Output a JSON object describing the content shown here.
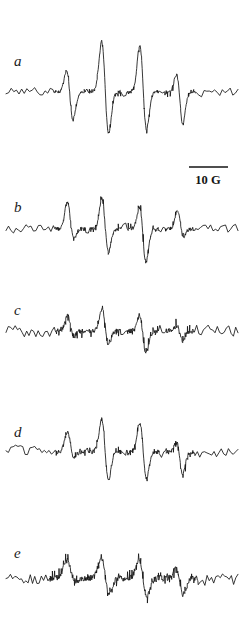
{
  "figure": {
    "type": "epr-spectra-stack",
    "width": 245,
    "height": 631,
    "background_color": "#ffffff",
    "line_color": "#141414"
  },
  "scale_bar": {
    "label": "10 G",
    "x_start": 189,
    "x_end": 228,
    "y": 167,
    "text_x": 208,
    "text_y": 184,
    "gauss_value": 10,
    "units": "G"
  },
  "chart_data": {
    "type": "line",
    "title": "",
    "subtitle": "",
    "xlabel": "",
    "ylabel": "",
    "grid": false,
    "legend_position": "none",
    "axis_visible": false,
    "x_range": [
      0,
      245
    ],
    "y_range_note": "arbitrary derivative intensity, each trace on own baseline",
    "scale_reference": {
      "length_px": 39,
      "value": 10,
      "units": "G"
    },
    "hyperfine_line_positions_px": [
      70,
      105,
      143,
      180
    ],
    "hyperfine_line_count": 4,
    "series": [
      {
        "name": "a",
        "label": "a",
        "label_x": 14,
        "label_y": 66,
        "baseline_y": 92,
        "x_start": 6,
        "x_end": 238,
        "noise_amplitude": 5.0,
        "noise_seed": 101,
        "noise_step": 2.6,
        "smooth": 0.22,
        "drift": [
          0,
          1,
          0,
          -1,
          0
        ],
        "peaks": [
          {
            "center": 70,
            "up": 38,
            "down": 44,
            "width": 3.1,
            "sep": 3.4
          },
          {
            "center": 105,
            "up": 80,
            "down": 72,
            "width": 3.3,
            "sep": 3.6
          },
          {
            "center": 143,
            "up": 74,
            "down": 66,
            "width": 3.2,
            "sep": 3.5
          },
          {
            "center": 180,
            "up": 34,
            "down": 46,
            "width": 3.0,
            "sep": 3.3
          }
        ]
      },
      {
        "name": "b",
        "label": "b",
        "label_x": 14,
        "label_y": 212,
        "baseline_y": 229,
        "x_start": 6,
        "x_end": 238,
        "noise_amplitude": 5.4,
        "noise_seed": 227,
        "noise_step": 2.5,
        "smooth": 0.2,
        "drift": [
          0,
          0,
          1,
          0,
          0
        ],
        "peaks": [
          {
            "center": 70,
            "up": 37,
            "down": 22,
            "width": 3.0,
            "sep": 3.3
          },
          {
            "center": 105,
            "up": 47,
            "down": 41,
            "width": 3.1,
            "sep": 3.4
          },
          {
            "center": 143,
            "up": 40,
            "down": 50,
            "width": 3.1,
            "sep": 3.4
          },
          {
            "center": 180,
            "up": 25,
            "down": 16,
            "width": 2.9,
            "sep": 3.2
          }
        ]
      },
      {
        "name": "c",
        "label": "c",
        "label_x": 14,
        "label_y": 315,
        "baseline_y": 331,
        "x_start": 6,
        "x_end": 238,
        "noise_amplitude": 6.6,
        "noise_seed": 349,
        "noise_step": 2.3,
        "smooth": 0.16,
        "drift": [
          0,
          -1,
          0,
          1,
          0
        ],
        "peaks": [
          {
            "center": 70,
            "up": 21,
            "down": 12,
            "width": 3.0,
            "sep": 3.2
          },
          {
            "center": 105,
            "up": 33,
            "down": 26,
            "width": 3.1,
            "sep": 3.3
          },
          {
            "center": 143,
            "up": 29,
            "down": 35,
            "width": 3.1,
            "sep": 3.3
          },
          {
            "center": 180,
            "up": 10,
            "down": 14,
            "width": 2.9,
            "sep": 3.1
          }
        ]
      },
      {
        "name": "d",
        "label": "d",
        "label_x": 14,
        "label_y": 437,
        "baseline_y": 452,
        "x_start": 6,
        "x_end": 238,
        "noise_amplitude": 6.0,
        "noise_seed": 463,
        "noise_step": 2.4,
        "smooth": 0.18,
        "drift": [
          1,
          0,
          0,
          -1,
          0
        ],
        "peaks": [
          {
            "center": 70,
            "up": 27,
            "down": 14,
            "width": 3.0,
            "sep": 3.3
          },
          {
            "center": 105,
            "up": 52,
            "down": 48,
            "width": 3.2,
            "sep": 3.5
          },
          {
            "center": 143,
            "up": 48,
            "down": 45,
            "width": 3.2,
            "sep": 3.5
          },
          {
            "center": 180,
            "up": 20,
            "down": 30,
            "width": 3.0,
            "sep": 3.2
          }
        ]
      },
      {
        "name": "e",
        "label": "e",
        "label_x": 14,
        "label_y": 558,
        "baseline_y": 578,
        "x_start": 6,
        "x_end": 238,
        "noise_amplitude": 8.2,
        "noise_seed": 587,
        "noise_step": 2.2,
        "smooth": 0.13,
        "drift": [
          0,
          1,
          0,
          0,
          0
        ],
        "peaks": [
          {
            "center": 70,
            "up": 22,
            "down": 10,
            "width": 4.0,
            "sep": 4.2
          },
          {
            "center": 105,
            "up": 34,
            "down": 30,
            "width": 3.8,
            "sep": 4.0
          },
          {
            "center": 143,
            "up": 32,
            "down": 32,
            "width": 3.8,
            "sep": 4.0
          },
          {
            "center": 180,
            "up": 18,
            "down": 24,
            "width": 3.6,
            "sep": 3.8
          }
        ]
      }
    ]
  }
}
